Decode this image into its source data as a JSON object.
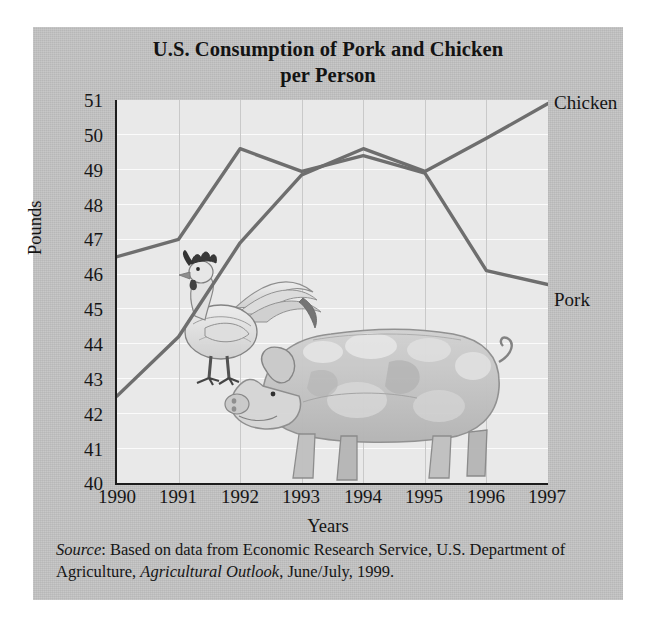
{
  "chart_data": {
    "type": "line",
    "title": "U.S. Consumption of Pork and Chicken per Person",
    "title_line1": "U.S. Consumption of Pork and Chicken",
    "title_line2": "per Person",
    "xlabel": "Years",
    "ylabel": "Pounds",
    "categories": [
      "1990",
      "1991",
      "1992",
      "1993",
      "1994",
      "1995",
      "1996",
      "1997"
    ],
    "x": [
      1990,
      1991,
      1992,
      1993,
      1994,
      1995,
      1996,
      1997
    ],
    "xlim": [
      1990,
      1997
    ],
    "ylim": [
      40,
      51
    ],
    "yticks": [
      "51",
      "50",
      "49",
      "48",
      "47",
      "46",
      "45",
      "44",
      "43",
      "42",
      "41",
      "40"
    ],
    "grid": true,
    "legend_position": "right-end-of-line",
    "series": [
      {
        "name": "Pork",
        "label": "Pork",
        "color": "#6e6e6e",
        "values": [
          46.5,
          47.0,
          49.6,
          48.95,
          49.4,
          48.9,
          46.1,
          45.7
        ]
      },
      {
        "name": "Chicken",
        "label": "Chicken",
        "color": "#6e6e6e",
        "values": [
          42.5,
          44.2,
          46.9,
          48.85,
          49.6,
          48.95,
          49.9,
          50.9
        ]
      }
    ],
    "annotations": [
      "Illustration of a rooster and a spotted pig inside the plot area"
    ]
  },
  "figure": {
    "background_color": "#c3c3c3",
    "plot_background_color": "#e9e9e9",
    "axis_color": "#1c1c1c",
    "line_color": "#6e6e6e"
  },
  "source": {
    "prefix": "Source",
    "text_part1": ": Based on data from Economic Research Service, U.S. Department of Agriculture, ",
    "italic_title": "Agricultural Outlook",
    "text_part2": ", June/July, 1999."
  },
  "illustration": {
    "rooster_label": "rooster-illustration",
    "pig_label": "pig-illustration"
  }
}
